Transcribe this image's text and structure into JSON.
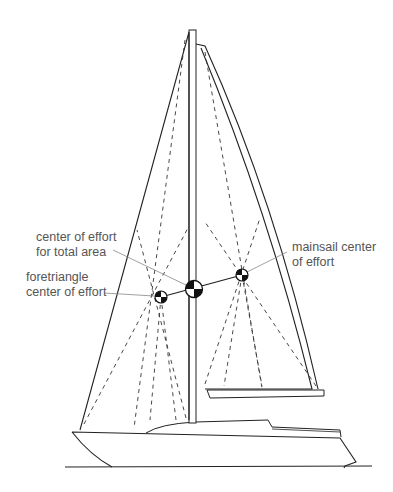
{
  "diagram": {
    "labels": {
      "total": [
        "center of effort",
        "for total area"
      ],
      "foretriangle": [
        "foretriangle",
        "center of effort"
      ],
      "mainsail": [
        "mainsail center",
        "of effort"
      ]
    },
    "markers": [
      {
        "id": "foretriangle-ce",
        "name": "foretriangle center of effort"
      },
      {
        "id": "total-ce",
        "name": "center of effort for total area"
      },
      {
        "id": "mainsail-ce",
        "name": "mainsail center of effort"
      }
    ],
    "colors": {
      "line": "#222222",
      "leader": "#888888",
      "text": "#555555",
      "marker_dark": "#111111",
      "background": "#ffffff"
    }
  }
}
